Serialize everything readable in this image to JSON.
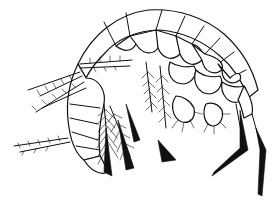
{
  "figure": {
    "style": "black ink on white",
    "colors": {
      "ink": "#111111",
      "background": "#ffffff"
    }
  }
}
